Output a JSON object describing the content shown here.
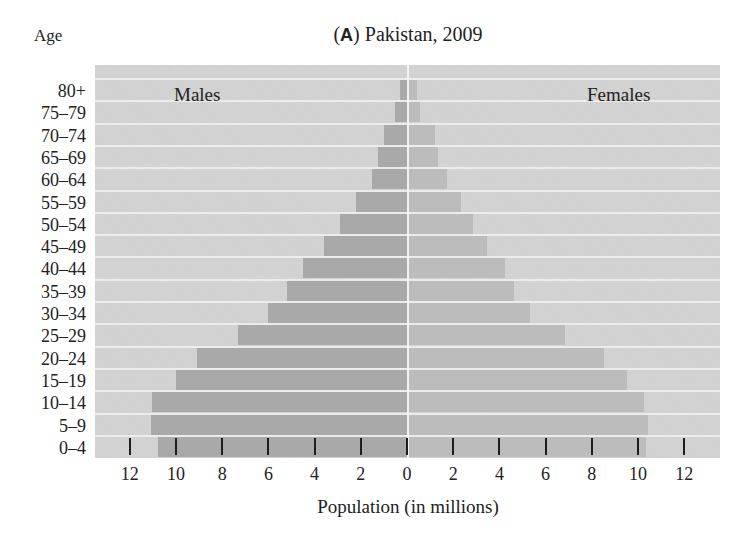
{
  "chart_data": {
    "type": "bar",
    "subtype": "population-pyramid",
    "title": "(A) Pakistan, 2009",
    "title_panel_letter": "A",
    "title_text": "Pakistan, 2009",
    "ylabel": "Age",
    "xlabel": "Population (in millions)",
    "categories": [
      "80+",
      "75–79",
      "70–74",
      "65–69",
      "60–64",
      "55–59",
      "50–54",
      "45–49",
      "40–44",
      "35–39",
      "30–34",
      "25–29",
      "20–24",
      "15–19",
      "10–14",
      "5–9",
      "0–4"
    ],
    "series": [
      {
        "name": "Males",
        "side": "left",
        "color": "#a9a9a9",
        "values": [
          0.3,
          0.5,
          1.0,
          1.25,
          1.5,
          2.2,
          2.9,
          3.6,
          4.5,
          5.2,
          6.0,
          7.3,
          9.1,
          10.0,
          11.05,
          11.1,
          10.8
        ]
      },
      {
        "name": "Females",
        "side": "right",
        "color": "#bcbcbc",
        "values": [
          0.4,
          0.5,
          1.15,
          1.3,
          1.7,
          2.3,
          2.8,
          3.4,
          4.2,
          4.6,
          5.3,
          6.8,
          8.5,
          9.5,
          10.2,
          10.4,
          10.3
        ]
      }
    ],
    "xticks_left": [
      "12",
      "10",
      "8",
      "6",
      "4",
      "2",
      "0"
    ],
    "xticks_right": [
      "2",
      "4",
      "6",
      "8",
      "10",
      "12"
    ],
    "xlim": [
      -13.5,
      13.5
    ],
    "legend": [
      "Males",
      "Females"
    ],
    "legend_position": "inside top (Males left, Females right)",
    "grid": false,
    "background_color": "#d1d1d1"
  },
  "labels": {
    "age": "Age",
    "title_open": "(",
    "title_letter": "A",
    "title_close": ") Pakistan, 2009",
    "males": "Males",
    "females": "Females",
    "xlabel": "Population (in millions)"
  }
}
